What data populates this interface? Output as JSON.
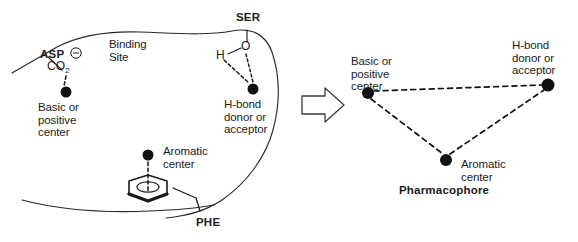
{
  "figure": {
    "width": 578,
    "height": 242,
    "background": "#ffffff",
    "ink": "#1c1c1c",
    "dot_color": "#111111"
  },
  "left_panel": {
    "name": "binding-site-panel",
    "site_label": "Binding\nSite",
    "residues": [
      {
        "id": "asp",
        "label": "ASP",
        "x": 40,
        "y": 55,
        "bold": true
      },
      {
        "id": "ser",
        "label": "SER",
        "x": 236,
        "y": 18,
        "bold": true
      },
      {
        "id": "phe",
        "label": "PHE",
        "x": 196,
        "y": 222,
        "bold": true
      }
    ],
    "chemical_groups": [
      {
        "id": "carboxylate",
        "text": "CO",
        "subscript": "2",
        "charge": "⊖",
        "x": 47,
        "y": 64
      },
      {
        "id": "hydroxyl-h",
        "text": "H",
        "x": 218,
        "y": 56
      },
      {
        "id": "hydroxyl-o",
        "text": "O",
        "x": 243,
        "y": 47
      }
    ],
    "features": [
      {
        "id": "basic-positive-center",
        "label": "Basic or\npositive\ncenter",
        "dot": {
          "x": 66,
          "y": 92,
          "r": 5.5
        },
        "label_x": 38,
        "label_y": 101
      },
      {
        "id": "hbond-donor-acceptor",
        "label": "H-bond\ndonor or\nacceptor",
        "dot": {
          "x": 253,
          "y": 89,
          "r": 5.5
        },
        "label_x": 224,
        "label_y": 98
      },
      {
        "id": "aromatic-center",
        "label": "Aromatic\ncenter",
        "dot": {
          "x": 148,
          "y": 155,
          "r": 5.5
        },
        "label_x": 163,
        "label_y": 145
      }
    ]
  },
  "arrow": {
    "name": "transformation-arrow",
    "direction": "right",
    "x": 302,
    "y": 103
  },
  "right_panel": {
    "name": "pharmacophore-panel",
    "caption": "Pharmacophore",
    "caption_x": 399,
    "caption_y": 184,
    "points": [
      {
        "id": "basic-positive-center",
        "label": "Basic or\npositive\ncenter",
        "dot": {
          "x": 368,
          "y": 93,
          "r": 6
        },
        "label_x": 351,
        "label_y": 55
      },
      {
        "id": "hbond-donor-acceptor",
        "label": "H-bond\ndonor or\nacceptor",
        "dot": {
          "x": 548,
          "y": 85,
          "r": 6.5
        },
        "label_x": 512,
        "label_y": 39
      },
      {
        "id": "aromatic-center",
        "label": "Aromatic\ncenter",
        "dot": {
          "x": 446,
          "y": 160,
          "r": 6
        },
        "label_x": 461,
        "label_y": 158
      }
    ],
    "edges": [
      {
        "from": "basic-positive-center",
        "to": "hbond-donor-acceptor",
        "style": "dashed"
      },
      {
        "from": "basic-positive-center",
        "to": "aromatic-center",
        "style": "dashed"
      },
      {
        "from": "aromatic-center",
        "to": "hbond-donor-acceptor",
        "style": "dashed"
      }
    ]
  }
}
